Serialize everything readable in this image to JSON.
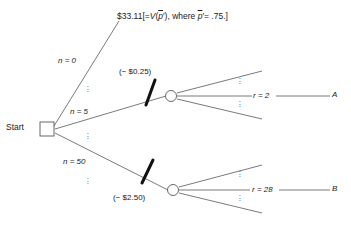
{
  "diagram": {
    "type": "decision-tree",
    "stroke_color": "#58585a",
    "text_color": "#1a1a1a",
    "mark_color": "#111111"
  },
  "nodes": {
    "start": {
      "label": "Start",
      "shape": "square",
      "kind": "decision-node",
      "x": 46,
      "y": 129
    },
    "chance_upper": {
      "shape": "circle",
      "kind": "chance-node",
      "x": 171,
      "y": 96
    },
    "chance_lower": {
      "shape": "circle",
      "kind": "chance-node",
      "x": 173,
      "y": 190
    }
  },
  "branches": {
    "n0": {
      "label": "n = 0",
      "value": 0
    },
    "n5": {
      "label": "n = 5",
      "value": 5
    },
    "n50": {
      "label": "n = 50",
      "value": 50
    },
    "ellipsis": "⋮"
  },
  "costs": {
    "upper": "(− $0.25)",
    "upper_value": -0.25,
    "lower": "(− $2.50)",
    "lower_value": -2.5
  },
  "payoff": {
    "amount": "$33.11",
    "bracket_open": "[",
    "equals": "=",
    "function": "V",
    "paren_open": "(",
    "p_symbol": "p",
    "prime": "′",
    "paren_close": ")",
    "comma": ",",
    "where": "where",
    "p_value": "= .75.",
    "bracket_close": "]"
  },
  "outcomes": {
    "upper": {
      "r_label": "r = 2",
      "r_value": 2,
      "terminal": "A"
    },
    "lower": {
      "r_label": "r = 28",
      "r_value": 28,
      "terminal": "B"
    }
  },
  "dots": {
    "glyph": "·"
  }
}
